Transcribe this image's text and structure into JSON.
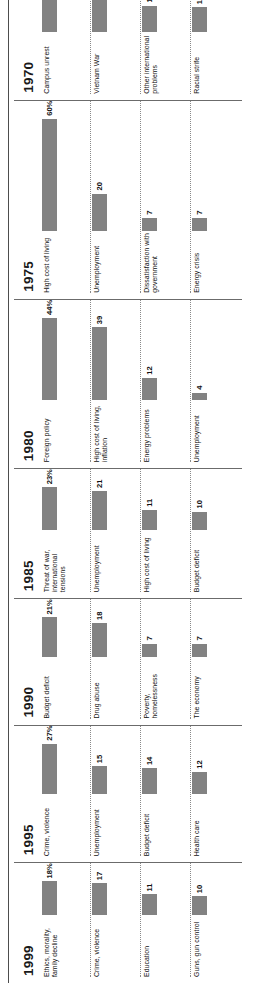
{
  "chart_data": {
    "type": "bar",
    "title": "",
    "xlabel": "",
    "ylabel": "",
    "grid": false,
    "legend": "none",
    "orientation": "horizontal",
    "panel_layout": "small-multiples by year",
    "value_suffix_first_row": "%",
    "bar_color": "#828282",
    "max_value": 60,
    "panels": [
      {
        "year": "1999",
        "items": [
          {
            "label": "Ethics, morality, family decline",
            "value": 18,
            "display": "18%"
          },
          {
            "label": "Crime, violence",
            "value": 17,
            "display": "17"
          },
          {
            "label": "Education",
            "value": 11,
            "display": "11"
          },
          {
            "label": "Guns, gun control",
            "value": 10,
            "display": "10"
          }
        ]
      },
      {
        "year": "1995",
        "items": [
          {
            "label": "Crime, violence",
            "value": 27,
            "display": "27%"
          },
          {
            "label": "Unemployment",
            "value": 15,
            "display": "15"
          },
          {
            "label": "Budget deficit",
            "value": 14,
            "display": "14"
          },
          {
            "label": "Health care",
            "value": 12,
            "display": "12"
          }
        ]
      },
      {
        "year": "1990",
        "items": [
          {
            "label": "Budget deficit",
            "value": 21,
            "display": "21%"
          },
          {
            "label": "Drug abuse",
            "value": 18,
            "display": "18"
          },
          {
            "label": "Poverty, homelessness",
            "value": 7,
            "display": "7"
          },
          {
            "label": "The economy",
            "value": 7,
            "display": "7"
          }
        ]
      },
      {
        "year": "1985",
        "items": [
          {
            "label": "Threat of war, international tensions",
            "value": 23,
            "display": "23%"
          },
          {
            "label": "Unemployment",
            "value": 21,
            "display": "21"
          },
          {
            "label": "High cost of living",
            "value": 11,
            "display": "11"
          },
          {
            "label": "Budget deficit",
            "value": 10,
            "display": "10"
          }
        ]
      },
      {
        "year": "1980",
        "items": [
          {
            "label": "Foreign policy",
            "value": 44,
            "display": "44%"
          },
          {
            "label": "High cost of living, inflation",
            "value": 39,
            "display": "39"
          },
          {
            "label": "Energy problems",
            "value": 12,
            "display": "12"
          },
          {
            "label": "Unemployment",
            "value": 4,
            "display": "4"
          }
        ]
      },
      {
        "year": "1975",
        "items": [
          {
            "label": "High cost of living",
            "value": 60,
            "display": "60%"
          },
          {
            "label": "Unemployment",
            "value": 20,
            "display": "20"
          },
          {
            "label": "Dissatisfaction with government",
            "value": 7,
            "display": "7"
          },
          {
            "label": "Energy crisis",
            "value": 7,
            "display": "7"
          }
        ]
      },
      {
        "year": "1970",
        "items": [
          {
            "label": "Campus unrest",
            "value": 27,
            "display": "27%"
          },
          {
            "label": "Vietnam War",
            "value": 22,
            "display": "22"
          },
          {
            "label": "Other international problems",
            "value": 14,
            "display": "14"
          },
          {
            "label": "Racial strife",
            "value": 13,
            "display": "13"
          }
        ]
      },
      {
        "year": "1965",
        "items": [
          {
            "label": "Civil rights",
            "value": 52,
            "display": "52%"
          },
          {
            "label": "Foreign affairs",
            "value": 39,
            "display": "39"
          },
          {
            "label": "Immorality, crime, juvenile delinquency",
            "value": 4,
            "display": "4"
          },
          {
            "label": "High cost of living",
            "value": 3,
            "display": "3"
          }
        ]
      },
      {
        "year": "1959",
        "items": [
          {
            "label": "Keeping the peace",
            "value": 38,
            "display": "38%"
          },
          {
            "label": "High cost of living",
            "value": 17,
            "display": "17"
          },
          {
            "label": "Integration",
            "value": 10,
            "display": "10"
          },
          {
            "label": "Unemployment",
            "value": 9,
            "display": "9"
          }
        ]
      },
      {
        "year": "1954",
        "items": [
          {
            "label": "Threat of war",
            "value": 18,
            "display": "18%"
          },
          {
            "label": "Communism in U.S.",
            "value": 17,
            "display": "17"
          },
          {
            "label": "Unemployment",
            "value": 16,
            "display": "16"
          },
          {
            "label": "High cost of living",
            "value": 13,
            "display": "13"
          }
        ]
      },
      {
        "year": "1950",
        "items": [
          {
            "label": "War",
            "value": 40,
            "display": "40%"
          },
          {
            "label": "The economy",
            "value": 15,
            "display": "15"
          },
          {
            "label": "Unemployment",
            "value": 10,
            "display": "10"
          },
          {
            "label": "Communism",
            "value": 8,
            "display": "8"
          }
        ]
      }
    ]
  }
}
